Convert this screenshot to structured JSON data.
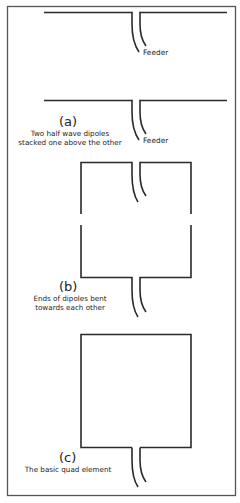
{
  "colors": {
    "frame": "#555555",
    "wire": "#2a2a2a",
    "text": "#222222",
    "background": "#ffffff"
  },
  "figures": [
    {
      "id": "a",
      "letter": "(a)",
      "caption_lines": [
        "Two half wave dipoles",
        "stacked one above the other"
      ],
      "feeder_labels": [
        "Feeder",
        "Feeder"
      ]
    },
    {
      "id": "b",
      "letter": "(b)",
      "caption_lines": [
        "Ends of dipoles bent",
        "towards each other"
      ]
    },
    {
      "id": "c",
      "letter": "(c)",
      "caption_lines": [
        "The basic quad element"
      ]
    }
  ]
}
